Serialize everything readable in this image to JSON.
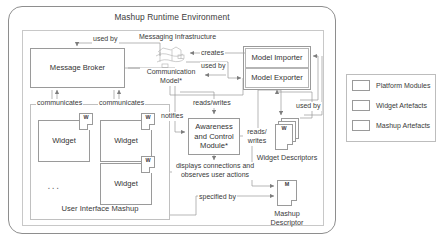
{
  "diagram": {
    "title": "Mashup Runtime Environment",
    "platform_region_label": "",
    "messaging_infrastructure_label": "Messaging Infrastructure"
  },
  "nodes": {
    "message_broker": "Message Broker",
    "model_importer": "Model  Importer",
    "model_exporter": "Model  Exporter",
    "communication_model": "Communication Model*",
    "awareness_module": "Awareness and Control Module*",
    "widget_1": "Widget",
    "widget_2": "Widget",
    "widget_3": "Widget",
    "widget_ellipsis": "...",
    "ui_mashup": "User Interface Mashup",
    "widget_descriptors": "Widget Descriptors",
    "mashup_descriptor": "Mashup Descriptor",
    "widget_doc_letter": "W",
    "mashup_doc_letter": "M"
  },
  "edges": {
    "used_by_top": "used by",
    "creates": "creates",
    "used_by_model": "used by",
    "communicates_1": "communicates",
    "communicates_2": "communicates",
    "reads_writes_top": "reads/writes",
    "used_by_descriptors": "used by",
    "notifies": "notifies",
    "reads_writes_side": "reads/ writes",
    "displays_observes": "displays connections and observes user actions",
    "specified_by": "specified by"
  },
  "legend": {
    "items": [
      {
        "label": "Platform Modules",
        "color": "#ffffff"
      },
      {
        "label": "Widget Artefacts",
        "color": "#ffffff"
      },
      {
        "label": "Mashup Artefacts",
        "color": "#ffffff"
      }
    ]
  },
  "colors": {
    "frame_border": "#8e8e8e",
    "box_border": "#9a9a9a",
    "text": "#3a3a3a",
    "wire": "#9a9a9a",
    "background": "#ffffff"
  }
}
